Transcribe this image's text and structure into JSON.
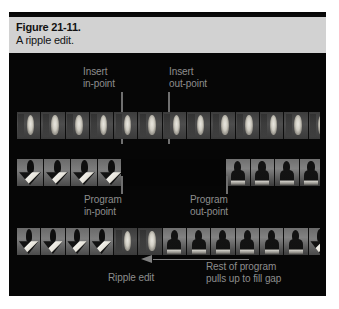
{
  "figure": {
    "caption_title": "Figure 21-11.",
    "caption_subtitle": "A ripple edit.",
    "panel_bg": "#060606",
    "caption_bg": "#d2d2d2",
    "label_color": "#8d8d8d",
    "marker_color": "#6f6f6f"
  },
  "labels": {
    "insert_in": "Insert\nin-point",
    "insert_out": "Insert\nout-point",
    "program_in": "Program\nin-point",
    "program_out": "Program\nout-point",
    "ripple_edit": "Ripple edit",
    "rest_of_program": "Rest of program\npulls up to fill gap"
  },
  "strips": {
    "source": {
      "name": "source-clip-strip",
      "frames": [
        "candle",
        "candle",
        "candle",
        "candle",
        "candle",
        "candle",
        "candle",
        "candle",
        "candle",
        "candle",
        "candle",
        "candle",
        "candle"
      ]
    },
    "program": {
      "name": "program-timeline-strip",
      "left_frames": [
        "tri",
        "tri",
        "tri",
        "tri"
      ],
      "gap": true,
      "right_frames": [
        "person",
        "person",
        "person",
        "person"
      ]
    },
    "result": {
      "name": "result-timeline-strip",
      "frames": [
        "tri",
        "tri",
        "tri",
        "tri",
        "candle",
        "candle",
        "person",
        "person",
        "person",
        "person",
        "person",
        "person",
        "tri"
      ]
    }
  },
  "markers": [
    {
      "name": "insert-in-point-marker",
      "x": 121,
      "y": 93,
      "height": 30
    },
    {
      "name": "insert-out-point-marker",
      "x": 168,
      "y": 93,
      "height": 30
    },
    {
      "name": "program-in-point-marker",
      "x": 121,
      "y": 176,
      "height": 17
    },
    {
      "name": "program-out-point-marker",
      "x": 226,
      "y": 176,
      "height": 17
    }
  ],
  "arrow": {
    "name": "ripple-pull-up-arrow",
    "direction": "left",
    "color": "#7f7f7f"
  }
}
